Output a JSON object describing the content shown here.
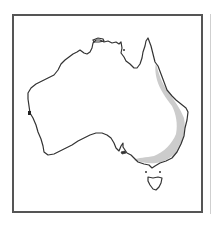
{
  "map": {
    "title": "Distribution map of Australia",
    "region": "Australia",
    "highlighted_range": "Eastern and south-eastern Australia",
    "colors": {
      "frame": "#555555",
      "coastline": "#333333",
      "land": "#ffffff",
      "range_shading": "#cccccc",
      "background": "#ffffff"
    }
  }
}
